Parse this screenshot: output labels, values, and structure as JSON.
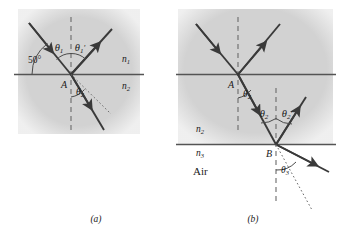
{
  "figure": {
    "type": "optics-ray-diagram",
    "background": "#ffffff",
    "medium_fill": "#d2d2d2",
    "ray_color": "#3a3a3a",
    "interface_color": "#545454"
  },
  "panel_a": {
    "caption": "(a)",
    "point_label": "A",
    "media": {
      "upper": "n",
      "upper_sub": "1",
      "lower": "n",
      "lower_sub": "2"
    },
    "angles": {
      "incident": "θ",
      "incident_sub": "1",
      "reflected": "θ",
      "reflected_sub": "1",
      "reflected_prime": "′",
      "refracted": "θ",
      "refracted_sub": "2",
      "grazing": "50°"
    }
  },
  "panel_b": {
    "caption": "(b)",
    "point_label_top": "A",
    "point_label_bottom": "B",
    "media": {
      "upper": "n",
      "upper_sub": "1",
      "middle": "n",
      "middle_sub": "2",
      "lower": "n",
      "lower_sub": "3",
      "lower_name": "Air"
    },
    "angles": {
      "refracted_top": "θ",
      "refracted_top_sub": "2",
      "incident_bottom": "θ",
      "incident_bottom_sub": "2",
      "reflected_bottom": "θ",
      "reflected_bottom_sub": "2",
      "reflected_bottom_prime": "′",
      "transmitted": "θ",
      "transmitted_sub": "3"
    }
  }
}
